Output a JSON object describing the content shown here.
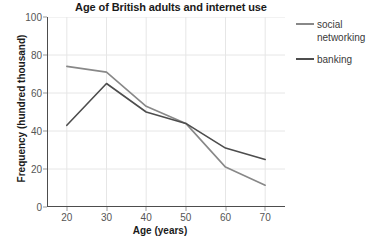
{
  "chart_data": {
    "type": "line",
    "title": "Age of British adults and internet use",
    "xlabel": "Age (years)",
    "ylabel": "Frequency (hundred thousand)",
    "x": [
      20,
      30,
      40,
      50,
      60,
      70
    ],
    "xlim": [
      15,
      75
    ],
    "ylim": [
      0,
      100
    ],
    "xticks": [
      "20",
      "30",
      "40",
      "50",
      "60",
      "70"
    ],
    "yticks": [
      "0",
      "20",
      "40",
      "60",
      "80",
      "100"
    ],
    "grid": true,
    "legend_position": "right",
    "series": [
      {
        "name": "social networking",
        "color": "#888888",
        "values": [
          74,
          71,
          53,
          44,
          21,
          11.5
        ]
      },
      {
        "name": "banking",
        "color": "#4d4d4d",
        "values": [
          43,
          65,
          50,
          44,
          31,
          25
        ]
      }
    ]
  },
  "legend": {
    "items": [
      {
        "label": "social networking"
      },
      {
        "label": "banking"
      }
    ]
  },
  "colors": {
    "background": "#ffffff",
    "grid": "#e6e6e6",
    "axis": "#4d4d4d",
    "tick_text": "#555555",
    "title_text": "#1a1a1a"
  }
}
